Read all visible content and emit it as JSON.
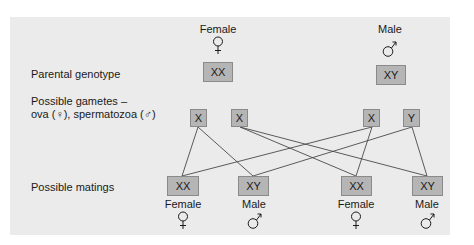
{
  "parents": {
    "female": {
      "label": "Female",
      "symbol": "female-symbol",
      "genotype": "XX"
    },
    "male": {
      "label": "Male",
      "symbol": "male-symbol",
      "genotype": "XY"
    }
  },
  "row_labels": {
    "parental": "Parental genotype",
    "gametes_line1": "Possible gametes –",
    "gametes_line2": "ova (♀), spermatozoa (♂)",
    "matings": "Possible matings"
  },
  "gametes": [
    {
      "id": "ovum-1",
      "label": "X",
      "parent": "female"
    },
    {
      "id": "ovum-2",
      "label": "X",
      "parent": "female"
    },
    {
      "id": "sperm-1",
      "label": "X",
      "parent": "male"
    },
    {
      "id": "sperm-2",
      "label": "Y",
      "parent": "male"
    }
  ],
  "matings": [
    {
      "genotype": "XX",
      "sex": "Female",
      "symbol": "female-symbol"
    },
    {
      "genotype": "XY",
      "sex": "Male",
      "symbol": "male-symbol"
    },
    {
      "genotype": "XX",
      "sex": "Female",
      "symbol": "female-symbol"
    },
    {
      "genotype": "XY",
      "sex": "Male",
      "symbol": "male-symbol"
    }
  ],
  "connections": [
    {
      "from": "ovum-1",
      "to": 0
    },
    {
      "from": "ovum-1",
      "to": 1
    },
    {
      "from": "ovum-2",
      "to": 2
    },
    {
      "from": "ovum-2",
      "to": 3
    },
    {
      "from": "sperm-1",
      "to": 0
    },
    {
      "from": "sperm-1",
      "to": 2
    },
    {
      "from": "sperm-2",
      "to": 1
    },
    {
      "from": "sperm-2",
      "to": 3
    }
  ],
  "colors": {
    "panel": "#ebebeb",
    "box": "#b5b5b5",
    "box_border": "#8a8a8a",
    "line": "#4a4a4a"
  }
}
